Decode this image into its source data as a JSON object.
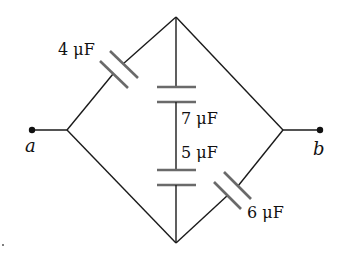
{
  "diagram": {
    "type": "capacitor-network",
    "terminals": {
      "left": "a",
      "right": "b"
    },
    "capacitors": [
      {
        "id": "C1",
        "label": "4 μF",
        "value": 4,
        "unit": "μF",
        "position": "upper-left edge"
      },
      {
        "id": "C2",
        "label": "7 μF",
        "value": 7,
        "unit": "μF",
        "position": "vertical branch, upper"
      },
      {
        "id": "C3",
        "label": "5 μF",
        "value": 5,
        "unit": "μF",
        "position": "vertical branch, lower"
      },
      {
        "id": "C4",
        "label": "6 μF",
        "value": 6,
        "unit": "μF",
        "position": "lower-right edge"
      }
    ]
  }
}
